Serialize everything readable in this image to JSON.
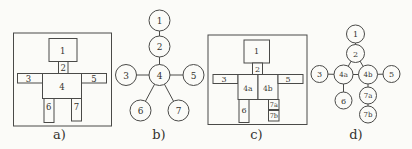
{
  "figure": {
    "width": 412,
    "height": 149,
    "paper_color": "#fbfbf8",
    "ink_color": "#4a4a48",
    "text_color": "#35332f"
  },
  "panels": [
    {
      "id": "a",
      "caption": "a)",
      "caption_x": 59.5,
      "caption_y": 139,
      "type": "blocks",
      "label_size": 8.5,
      "frame": {
        "x": 13.5,
        "y": 33,
        "w": 98,
        "h": 93
      },
      "boxes": [
        {
          "label": "1",
          "x": 49,
          "y": 38.5,
          "w": 28,
          "h": 23,
          "lx": 62.8,
          "ly": 50.8
        },
        {
          "label": "2",
          "x": 58.5,
          "y": 61.5,
          "w": 9.5,
          "h": 12,
          "lx": 63.3,
          "ly": 67.8
        },
        {
          "label": "3",
          "x": 17.5,
          "y": 73.5,
          "w": 25,
          "h": 9.5,
          "lx": 28.5,
          "ly": 78.5
        },
        {
          "label": "4",
          "x": 42.5,
          "y": 73.5,
          "w": 39,
          "h": 25,
          "lx": 62,
          "ly": 86.5
        },
        {
          "label": "5",
          "x": 81.5,
          "y": 73.5,
          "w": 25,
          "h": 9.5,
          "lx": 94,
          "ly": 78.5
        },
        {
          "label": "6",
          "x": 44,
          "y": 98.5,
          "w": 10,
          "h": 24,
          "lx": 48.8,
          "ly": 107
        },
        {
          "label": "7",
          "x": 71.5,
          "y": 98.5,
          "w": 10,
          "h": 22.5,
          "lx": 76.5,
          "ly": 107
        }
      ]
    },
    {
      "id": "b",
      "caption": "b)",
      "caption_x": 159,
      "caption_y": 139,
      "type": "graph",
      "label_size": 9,
      "nodes": [
        {
          "id": "1",
          "label": "1",
          "x": 159.5,
          "y": 20.5,
          "r": 10.5
        },
        {
          "id": "2",
          "label": "2",
          "x": 159.5,
          "y": 46.5,
          "r": 10.5
        },
        {
          "id": "3",
          "label": "3",
          "x": 126,
          "y": 75,
          "r": 10.5
        },
        {
          "id": "4",
          "label": "4",
          "x": 159.5,
          "y": 75,
          "r": 10.5
        },
        {
          "id": "5",
          "label": "5",
          "x": 193.5,
          "y": 75,
          "r": 10.5
        },
        {
          "id": "6",
          "label": "6",
          "x": 140.5,
          "y": 110.5,
          "r": 10.5
        },
        {
          "id": "7",
          "label": "7",
          "x": 178.5,
          "y": 110.5,
          "r": 10.5
        }
      ],
      "edges": [
        [
          "1",
          "2"
        ],
        [
          "2",
          "4"
        ],
        [
          "3",
          "4"
        ],
        [
          "4",
          "5"
        ],
        [
          "4",
          "6"
        ],
        [
          "4",
          "7"
        ]
      ]
    },
    {
      "id": "c",
      "caption": "c)",
      "caption_x": 256.5,
      "caption_y": 139,
      "type": "blocks",
      "label_size": 8,
      "frame": {
        "x": 208,
        "y": 35,
        "w": 99,
        "h": 89.5
      },
      "boxes": [
        {
          "label": "1",
          "x": 244,
          "y": 40,
          "w": 25.5,
          "h": 23,
          "lx": 256.5,
          "ly": 51.8
        },
        {
          "label": "2",
          "x": 252.5,
          "y": 63,
          "w": 10,
          "h": 11.5,
          "lx": 257.5,
          "ly": 69
        },
        {
          "label": "3",
          "x": 213,
          "y": 74.5,
          "w": 25,
          "h": 9,
          "lx": 224,
          "ly": 79
        },
        {
          "label": "4a",
          "x": 238,
          "y": 74.5,
          "w": 20,
          "h": 25,
          "lx": 247.8,
          "ly": 88,
          "fs": 7.5
        },
        {
          "label": "4b",
          "x": 258,
          "y": 74.5,
          "w": 20,
          "h": 25,
          "lx": 267.8,
          "ly": 88,
          "fs": 7.5
        },
        {
          "label": "5",
          "x": 278,
          "y": 74.5,
          "w": 25,
          "h": 9,
          "lx": 288,
          "ly": 79
        },
        {
          "label": "6",
          "x": 239,
          "y": 99.5,
          "w": 10,
          "h": 23,
          "lx": 244,
          "ly": 110
        },
        {
          "label": "7a",
          "x": 268.5,
          "y": 99.5,
          "w": 10.5,
          "h": 10,
          "lx": 273.8,
          "ly": 104.8,
          "fs": 6.5
        },
        {
          "label": "7b",
          "x": 268.5,
          "y": 110.5,
          "w": 10.5,
          "h": 10.5,
          "lx": 273.8,
          "ly": 116,
          "fs": 6.5
        }
      ]
    },
    {
      "id": "d",
      "caption": "d)",
      "caption_x": 356,
      "caption_y": 139,
      "type": "graph",
      "label_size": 8,
      "nodes": [
        {
          "id": "1",
          "label": "1",
          "x": 355.5,
          "y": 34,
          "r": 9
        },
        {
          "id": "2",
          "label": "2",
          "x": 355.5,
          "y": 53.5,
          "r": 9
        },
        {
          "id": "3",
          "label": "3",
          "x": 319.5,
          "y": 74,
          "r": 8.5
        },
        {
          "id": "4a",
          "label": "4a",
          "x": 343.5,
          "y": 74.5,
          "r": 9.5,
          "fs": 7
        },
        {
          "id": "4b",
          "label": "4b",
          "x": 368,
          "y": 74.5,
          "r": 9.5,
          "fs": 7
        },
        {
          "id": "5",
          "label": "5",
          "x": 391.5,
          "y": 74,
          "r": 8.5
        },
        {
          "id": "6",
          "label": "6",
          "x": 343.5,
          "y": 100.5,
          "r": 8.5
        },
        {
          "id": "7a",
          "label": "7a",
          "x": 368,
          "y": 95.5,
          "r": 8.5,
          "fs": 7
        },
        {
          "id": "7b",
          "label": "7b",
          "x": 368,
          "y": 114.5,
          "r": 8.5,
          "fs": 7
        }
      ],
      "edges": [
        [
          "1",
          "2"
        ],
        [
          "2",
          "4a"
        ],
        [
          "2",
          "4b"
        ],
        [
          "4a",
          "4b"
        ],
        [
          "3",
          "4a"
        ],
        [
          "4b",
          "5"
        ],
        [
          "4a",
          "6"
        ],
        [
          "4b",
          "7a"
        ],
        [
          "7a",
          "7b"
        ]
      ]
    }
  ]
}
